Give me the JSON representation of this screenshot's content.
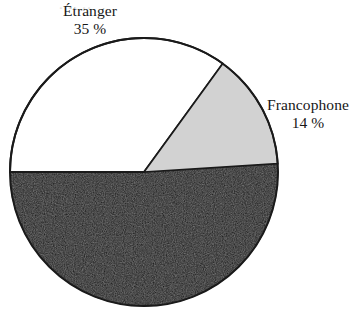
{
  "figure": {
    "background_color": "#ffffff",
    "slice_outline_color": "#1a1a1a"
  },
  "labels": {
    "etranger": {
      "name": "Étranger",
      "value": "35 %"
    },
    "francophone": {
      "name": "Francophone",
      "value": "14 %"
    },
    "bottom_clipped": {
      "text": "·  ··  ··"
    }
  },
  "chart_data": {
    "type": "pie",
    "title": "",
    "categories": [
      "Étranger",
      "Francophone",
      "Autre"
    ],
    "values": [
      35,
      14,
      51
    ],
    "value_labels": [
      "35 %",
      "14 %",
      ""
    ],
    "colors": [
      "#ffffff",
      "#d2d2d2",
      "#0d0d0d"
    ],
    "units": "percent",
    "start_angle_deg": 180,
    "direction": "clockwise",
    "legend": "none",
    "labels_position": "outside"
  },
  "geometry": {
    "center_x": 144,
    "center_y": 172,
    "radius": 134
  }
}
